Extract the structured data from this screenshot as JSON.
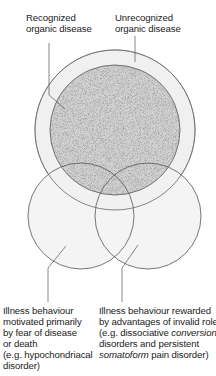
{
  "diagram": {
    "colors": {
      "stroke": "#555555",
      "outer_ring_fill": "#f1f1f1",
      "stipple_base": "#cfcfcf",
      "stipple_dot": "#6e6e6e",
      "lower_circle_fill": "#f4f4f4",
      "text": "#222222"
    },
    "labels": {
      "recognized": {
        "lines": [
          "Recognized",
          "organic disease"
        ]
      },
      "unrecognized": {
        "lines": [
          "Unrecognized",
          "organic disease"
        ]
      },
      "fear": {
        "lines": [
          "Illness behaviour",
          "motivated primarily",
          "by fear of disease",
          "or death",
          "(e.g. hypochondriacal",
          "disorder)"
        ]
      },
      "rewarded": {
        "line1": "Illness behaviour rewarded",
        "line2": "by advantages of invalid role",
        "line3_prefix": "(e.g. dissociative ",
        "line3_italic": "conversion",
        "line4": "disorders and persistent",
        "line5_italic": "somatoform",
        "line5_suffix": " pain disorder)"
      }
    },
    "shapes": {
      "outer_circle": {
        "cx": 115,
        "cy": 130,
        "r": 80,
        "meaning": "Unrecognized organic disease"
      },
      "inner_circle": {
        "cx": 115,
        "cy": 130,
        "r": 65,
        "meaning": "Recognized organic disease"
      },
      "left_circle": {
        "cx": 81,
        "cy": 216,
        "r": 53,
        "meaning": "Illness behaviour motivated by fear"
      },
      "right_circle": {
        "cx": 148,
        "cy": 216,
        "r": 53,
        "meaning": "Illness behaviour rewarded by invalid role"
      }
    }
  }
}
